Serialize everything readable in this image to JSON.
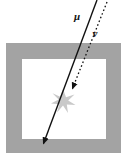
{
  "figure": {
    "background_color": "#ffffff",
    "width": 131,
    "height": 158
  },
  "detector": {
    "name": "detector-frame",
    "frame_color": "#a3a3a3",
    "interior_color": "#ffffff",
    "outer": {
      "x": 6,
      "y": 43,
      "width": 115,
      "height": 110
    },
    "inner": {
      "x": 22,
      "y": 59,
      "width": 84,
      "height": 80
    }
  },
  "tracks": {
    "muon": {
      "label": "μ",
      "label_x": 77,
      "label_y": 20,
      "style": "solid",
      "color": "#111111",
      "x1": 97,
      "y1": 0,
      "x2": 42,
      "y2": 147,
      "arrowhead": "filled-triangle",
      "arrow_at": "end"
    },
    "neutrino": {
      "label": "ν",
      "label_x": 95,
      "label_y": 37,
      "style": "dotted",
      "color": "#111111",
      "x1": 107,
      "y1": 2,
      "x2": 71,
      "y2": 92,
      "arrowhead": "filled-triangle",
      "arrow_at": "end"
    }
  },
  "vertex": {
    "name": "interaction-vertex",
    "shape": "star-burst",
    "color": "#c9c9c9",
    "cx": 63,
    "cy": 101,
    "radius_outer": 12,
    "radius_inner": 4,
    "points": 6
  }
}
